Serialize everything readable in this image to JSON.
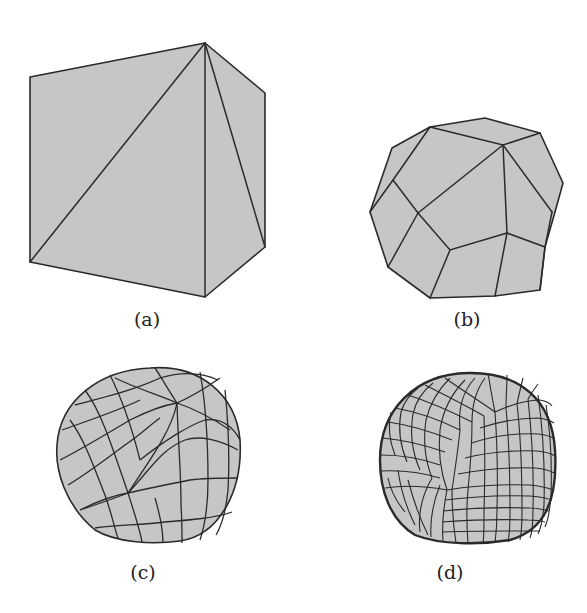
{
  "figure": {
    "panels": [
      {
        "id": "a",
        "caption": "(a)",
        "description": "Cube with triangulated faces (coarse input mesh)"
      },
      {
        "id": "b",
        "caption": "(b)",
        "description": "Polyhedral mesh after one subdivision step"
      },
      {
        "id": "c",
        "caption": "(c)",
        "description": "Quad mesh after further subdivision"
      },
      {
        "id": "d",
        "caption": "(d)",
        "description": "Fine quad mesh approaching a smooth surface"
      }
    ],
    "colors": {
      "face_fill": "#c6c6c6",
      "edge_stroke": "#2a2a2a",
      "background": "#ffffff"
    }
  }
}
